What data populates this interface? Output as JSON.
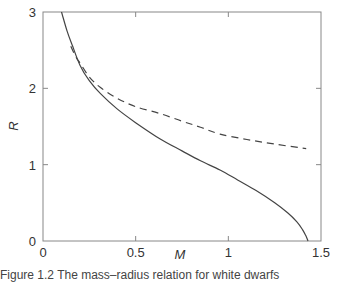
{
  "chart_data": {
    "type": "line",
    "title": "",
    "xlabel": "M",
    "ylabel": "R",
    "xlim": [
      0,
      1.5
    ],
    "ylim": [
      0,
      3
    ],
    "xticks": [
      "0",
      "0.5",
      "1",
      "1.5"
    ],
    "yticks": [
      "0",
      "1",
      "2",
      "3"
    ],
    "grid": false,
    "legend": null,
    "series": [
      {
        "name": "solid",
        "style": "solid",
        "x": [
          0.1,
          0.13,
          0.16,
          0.2,
          0.25,
          0.31,
          0.4,
          0.5,
          0.63,
          0.75,
          0.85,
          0.955,
          1.05,
          1.15,
          1.25,
          1.32,
          1.37,
          1.4,
          1.42,
          1.43
        ],
        "y": [
          3.0,
          2.75,
          2.55,
          2.3,
          2.1,
          1.93,
          1.73,
          1.55,
          1.34,
          1.18,
          1.05,
          0.93,
          0.8,
          0.66,
          0.5,
          0.37,
          0.25,
          0.15,
          0.06,
          0.0
        ]
      },
      {
        "name": "dashed",
        "style": "dashed",
        "x": [
          0.15,
          0.18,
          0.2,
          0.25,
          0.31,
          0.4,
          0.5,
          0.63,
          0.75,
          0.85,
          0.955,
          1.1,
          1.25,
          1.42
        ],
        "y": [
          2.55,
          2.4,
          2.33,
          2.15,
          2.01,
          1.87,
          1.76,
          1.67,
          1.57,
          1.49,
          1.4,
          1.33,
          1.27,
          1.21
        ]
      }
    ]
  },
  "caption": "Figure 1.2  The mass–radius relation for white dwarfs"
}
